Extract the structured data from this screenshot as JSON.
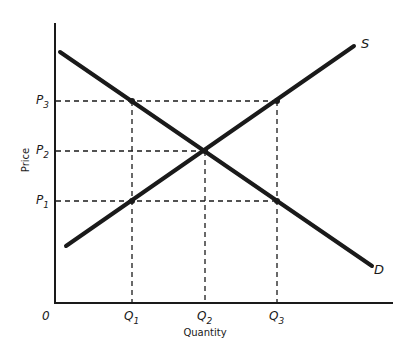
{
  "diagram": {
    "type": "supply-demand",
    "axes": {
      "x_label": "Quantity",
      "y_label": "Price",
      "origin_label": "0"
    },
    "curves": {
      "supply": {
        "label": "S"
      },
      "demand": {
        "label": "D"
      }
    },
    "price_levels": [
      {
        "base": "P",
        "sub": "3"
      },
      {
        "base": "P",
        "sub": "2"
      },
      {
        "base": "P",
        "sub": "1"
      }
    ],
    "quantity_levels": [
      {
        "base": "Q",
        "sub": "1"
      },
      {
        "base": "Q",
        "sub": "2"
      },
      {
        "base": "Q",
        "sub": "3"
      }
    ],
    "colors": {
      "line": "#1a1a1a",
      "background": "#ffffff"
    }
  }
}
